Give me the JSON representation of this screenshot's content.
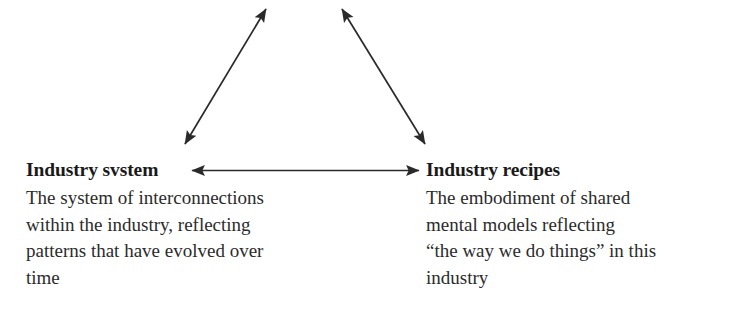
{
  "figure": {
    "background_color": "#ffffff",
    "ink_color": "#2a2a2a",
    "text_color": "#1a1a1a"
  },
  "nodes": [
    {
      "id": "industry-system",
      "heading": "Industry svstem",
      "body_lines": [
        "The system of interconnections",
        "within the industry, reflecting",
        "patterns that have evolved over",
        "time"
      ]
    },
    {
      "id": "industry-recipes",
      "heading": "Industry recipes",
      "body_lines": [
        "The embodiment of shared",
        "mental models reflecting",
        "“the way we do things” in this",
        "industry"
      ]
    }
  ],
  "connectors": [
    {
      "id": "left-diagonal",
      "style": "double-headed-arrow",
      "from": "industry-system",
      "to": "apex-offscreen"
    },
    {
      "id": "right-diagonal",
      "style": "double-headed-arrow",
      "from": "industry-recipes",
      "to": "apex-offscreen"
    },
    {
      "id": "horizontal",
      "style": "double-headed-arrow",
      "from": "industry-system",
      "to": "industry-recipes"
    }
  ]
}
